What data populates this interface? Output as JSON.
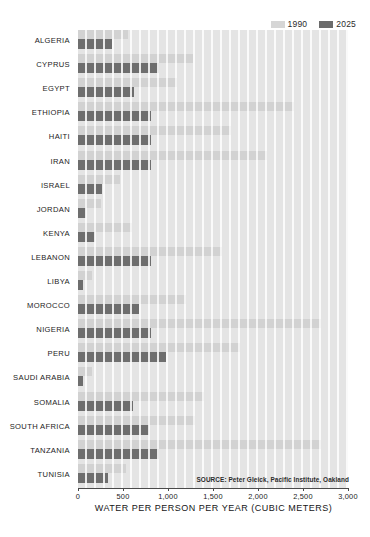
{
  "chart_data": {
    "type": "bar",
    "orientation": "horizontal",
    "title": "",
    "xlabel": "WATER PER PERSON PER YEAR (CUBIC METERS)",
    "ylabel": "",
    "xlim": [
      0,
      3000
    ],
    "xticks": [
      0,
      500,
      1000,
      1500,
      2000,
      2500,
      3000
    ],
    "xtick_labels": [
      "0",
      "500",
      "1,000",
      "1,500",
      "2,000",
      "2,500",
      "3,000"
    ],
    "grid": false,
    "legend_position": "top-right",
    "categories": [
      "ALGERIA",
      "CYPRUS",
      "EGYPT",
      "ETHIOPIA",
      "HAITI",
      "IRAN",
      "ISRAEL",
      "JORDAN",
      "KENYA",
      "LEBANON",
      "LIBYA",
      "MOROCCO",
      "NIGERIA",
      "PERU",
      "SAUDI ARABIA",
      "SOMALIA",
      "SOUTH AFRICA",
      "TANZANIA",
      "TUNISIA"
    ],
    "series": [
      {
        "name": "1990",
        "color": "#d2d2d2",
        "values": [
          550,
          1280,
          1100,
          2400,
          1700,
          2100,
          470,
          260,
          600,
          1600,
          160,
          1200,
          2700,
          1800,
          160,
          1400,
          1300,
          2700,
          530
        ]
      },
      {
        "name": "2025",
        "color": "#6e6e6e",
        "values": [
          380,
          900,
          620,
          810,
          810,
          810,
          270,
          90,
          190,
          810,
          60,
          680,
          810,
          980,
          50,
          610,
          790,
          900,
          330
        ]
      }
    ],
    "annotations": {
      "source": "SOURCE: Peter Gleick, Pacific Institute, Oakland"
    }
  },
  "legend": {
    "entries": [
      {
        "label": "1990"
      },
      {
        "label": "2025"
      }
    ]
  }
}
